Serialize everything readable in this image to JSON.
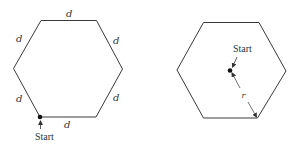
{
  "figure": {
    "colors": {
      "stroke": "#3a3a3a",
      "text": "#333333",
      "background": "#ffffff"
    },
    "left_panel": {
      "shape": "regular hexagon",
      "side_labels": [
        "d",
        "d",
        "d",
        "d",
        "d",
        "d"
      ],
      "start_label": "Start",
      "start_position": "bottom-left vertex"
    },
    "right_panel": {
      "shape": "regular hexagon",
      "start_label": "Start",
      "start_position": "center",
      "radius_label": "r"
    }
  }
}
